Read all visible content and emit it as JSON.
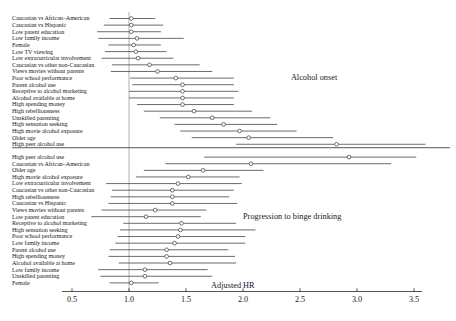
{
  "figure": {
    "axis_title": "Adjusted HR",
    "panels": [
      {
        "name": "Alcohol onset",
        "annotation_x": 2.42,
        "annotation_row": 9
      },
      {
        "name": "Progression to binge drinking",
        "annotation_x": 2.08,
        "annotation_row": 29
      }
    ]
  },
  "chart_data": {
    "type": "forest",
    "title": "",
    "xlabel": "Adjusted HR",
    "ylabel": "",
    "xlim": [
      0.5,
      3.5
    ],
    "xticks": [
      0.5,
      1.0,
      1.5,
      2.0,
      2.5,
      3.0,
      3.5
    ],
    "xticklabels": [
      "0.5",
      "1.0",
      "1.5",
      "2.0",
      "2.5",
      "3.0",
      "3.5"
    ],
    "xscale": "linear",
    "reference_line": 1.0,
    "grid": false,
    "legend": false,
    "marker": "open-circle",
    "panel_separator_after_index": 19,
    "groups": [
      {
        "label": "Alcohol onset",
        "rows": [
          {
            "label": "Caucasian vs African–American",
            "hr": 1.02,
            "low": 0.83,
            "high": 1.23
          },
          {
            "label": "Caucasian vs Hispanic",
            "hr": 1.02,
            "low": 0.78,
            "high": 1.3
          },
          {
            "label": "Low parent education",
            "hr": 1.02,
            "low": 0.72,
            "high": 1.28
          },
          {
            "label": "Low family income",
            "hr": 1.07,
            "low": 0.73,
            "high": 1.48
          },
          {
            "label": "Female",
            "hr": 1.04,
            "low": 0.82,
            "high": 1.28
          },
          {
            "label": "Low TV viewing",
            "hr": 1.06,
            "low": 0.79,
            "high": 1.33
          },
          {
            "label": "Low extracurricular involvement",
            "hr": 1.08,
            "low": 0.76,
            "high": 1.39
          },
          {
            "label": "Caucasian vs other non-Caucasian",
            "hr": 1.18,
            "low": 0.85,
            "high": 1.62
          },
          {
            "label": "Views movies without parents",
            "hr": 1.25,
            "low": 0.84,
            "high": 1.73
          },
          {
            "label": "Poor school performance",
            "hr": 1.41,
            "low": 1.01,
            "high": 1.92
          },
          {
            "label": "Parent alcohol use",
            "hr": 1.47,
            "low": 1.03,
            "high": 1.92
          },
          {
            "label": "Receptive to alcohol marketing",
            "hr": 1.47,
            "low": 1.0,
            "high": 1.96
          },
          {
            "label": "Alcohol available at home",
            "hr": 1.47,
            "low": 1.0,
            "high": 1.92
          },
          {
            "label": "High spending money",
            "hr": 1.47,
            "low": 1.07,
            "high": 1.92
          },
          {
            "label": "High rebelliousness",
            "hr": 1.57,
            "low": 1.13,
            "high": 2.08
          },
          {
            "label": "Unskilled parenting",
            "hr": 1.73,
            "low": 1.27,
            "high": 2.24
          },
          {
            "label": "High sensation seeking",
            "hr": 1.83,
            "low": 1.4,
            "high": 2.3
          },
          {
            "label": "High movie alcohol exposure",
            "hr": 1.97,
            "low": 1.45,
            "high": 2.47
          },
          {
            "label": "Older age",
            "hr": 2.05,
            "low": 1.55,
            "high": 2.79
          },
          {
            "label": "High peer alcohol use",
            "hr": 2.82,
            "low": 1.94,
            "high": 3.6
          }
        ]
      },
      {
        "label": "Progression to binge drinking",
        "rows": [
          {
            "label": "High peer alcohol use",
            "hr": 2.93,
            "low": 1.66,
            "high": 3.52
          },
          {
            "label": "Caucasian vs African–American",
            "hr": 2.07,
            "low": 1.32,
            "high": 3.3
          },
          {
            "label": "Older age",
            "hr": 1.65,
            "low": 1.13,
            "high": 2.18
          },
          {
            "label": "High movie alcohol exposure",
            "hr": 1.52,
            "low": 1.06,
            "high": 1.97
          },
          {
            "label": "Low extracurricular involvement",
            "hr": 1.43,
            "low": 0.8,
            "high": 1.99
          },
          {
            "label": "Caucasian vs other non-Caucasian",
            "hr": 1.38,
            "low": 0.85,
            "high": 1.92
          },
          {
            "label": "High rebelliousness",
            "hr": 1.38,
            "low": 0.84,
            "high": 1.88
          },
          {
            "label": "Caucasian vs Hispanic",
            "hr": 1.38,
            "low": 0.82,
            "high": 1.95
          },
          {
            "label": "Views movies without parents",
            "hr": 1.23,
            "low": 0.76,
            "high": 1.68
          },
          {
            "label": "Low parent education",
            "hr": 1.15,
            "low": 0.67,
            "high": 1.63
          },
          {
            "label": "Receptive to alcohol marketing",
            "hr": 1.46,
            "low": 0.95,
            "high": 1.94
          },
          {
            "label": "High sensation seeking",
            "hr": 1.45,
            "low": 0.92,
            "high": 2.11
          },
          {
            "label": "Poor school performance",
            "hr": 1.43,
            "low": 0.9,
            "high": 2.02
          },
          {
            "label": "Low family income",
            "hr": 1.4,
            "low": 0.88,
            "high": 2.02
          },
          {
            "label": "Parent alcohol use",
            "hr": 1.33,
            "low": 0.83,
            "high": 1.87
          },
          {
            "label": "High spending money",
            "hr": 1.33,
            "low": 0.82,
            "high": 1.93
          },
          {
            "label": "Alcohol available at home",
            "hr": 1.36,
            "low": 0.91,
            "high": 1.94
          },
          {
            "label": "Low family income",
            "hr": 1.14,
            "low": 0.73,
            "high": 1.69
          },
          {
            "label": "Unskilled parenting",
            "hr": 1.14,
            "low": 0.75,
            "high": 1.73
          },
          {
            "label": "Female",
            "hr": 1.02,
            "low": 0.83,
            "high": 1.26
          }
        ]
      }
    ]
  }
}
